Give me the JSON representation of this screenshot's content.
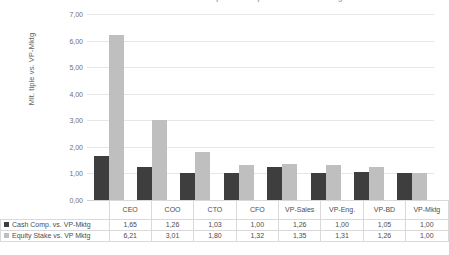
{
  "chart_data": {
    "type": "bar",
    "title": "Multiple of Compensation vs. VP-Mktg",
    "xlabel": "",
    "ylabel": "Mlt. tiple vs. VP-Mktg",
    "ylim": [
      0,
      7
    ],
    "ytick_labels": [
      "7,00",
      "6,00",
      "5,00",
      "4,00",
      "3,00",
      "2,00",
      "1,00",
      "0,00"
    ],
    "ytick_values": [
      7,
      6,
      5,
      4,
      3,
      2,
      1,
      0
    ],
    "grid": true,
    "legend_position": "bottom-left-table",
    "categories": [
      "CEO",
      "COO",
      "CTO",
      "CFO",
      "VP-Sales",
      "VP-Eng.",
      "VP-BD",
      "VP-Mktg"
    ],
    "series": [
      {
        "name": "Cash Comp. vs. VP-Mktg",
        "color": "#3e3e3e",
        "values": [
          1.65,
          1.26,
          1.03,
          1.0,
          1.26,
          1.0,
          1.05,
          1.0
        ],
        "labels": [
          "1,65",
          "1,26",
          "1,03",
          "1,00",
          "1,26",
          "1,00",
          "1,05",
          "1,00"
        ]
      },
      {
        "name": "Equity Stake vs. VP Mktg",
        "color": "#bfbfbf",
        "values": [
          6.21,
          3.01,
          1.8,
          1.32,
          1.35,
          1.31,
          1.26,
          1.0
        ],
        "labels": [
          "6,21",
          "3,01",
          "1,80",
          "1,32",
          "1,35",
          "1,31",
          "1,26",
          "1,00"
        ]
      }
    ]
  },
  "table": {
    "category_labels": [
      "CEO",
      "COO",
      "CTO",
      "CFO",
      "VP-Sales",
      "VP-Eng.",
      "VP-BD",
      "VP-Mktg"
    ]
  }
}
